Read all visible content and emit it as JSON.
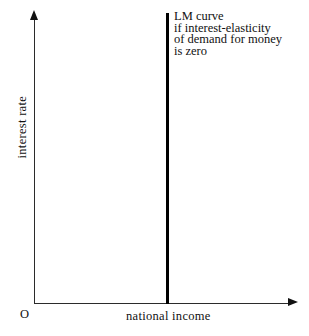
{
  "figure": {
    "background_color": "#ffffff",
    "axis_color": "#2b2b2b",
    "curve_color": "#000000"
  },
  "axes": {
    "origin_label": "O",
    "x_axis_label": "national income",
    "y_axis_label": "interest rate"
  },
  "annotation": {
    "lines": [
      "LM curve",
      "if interest-elasticity",
      "of demand for money",
      "is zero"
    ]
  },
  "chart_data": {
    "type": "line",
    "title": "",
    "xlabel": "national income",
    "ylabel": "interest rate",
    "grid": false,
    "legend": "none",
    "xlim": [
      0,
      1
    ],
    "ylim": [
      0,
      1
    ],
    "annotations": [
      {
        "text": "LM curve if interest-elasticity of demand for money is zero",
        "target_series": "LM curve",
        "x": 0.52,
        "y": 0.97
      }
    ],
    "series": [
      {
        "name": "LM curve",
        "description": "Vertical line: money demand is perfectly interest-inelastic, so national income is fixed at one level regardless of the interest rate.",
        "x": [
          0.52,
          0.52
        ],
        "y": [
          0.0,
          1.0
        ]
      }
    ]
  }
}
